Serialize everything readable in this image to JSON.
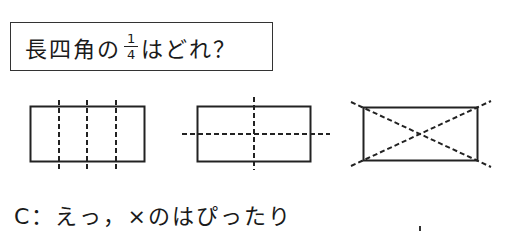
{
  "question": {
    "prefix": "長四角の",
    "fraction": {
      "numerator": "1",
      "denominator": "4"
    },
    "suffix": "はどれ？"
  },
  "figures": [
    {
      "id": "a",
      "description": "rectangle divided by three vertical dashed lines into four vertical strips"
    },
    {
      "id": "b",
      "description": "rectangle divided by one vertical and one horizontal dashed line into four quadrants"
    },
    {
      "id": "c",
      "description": "rectangle divided by two dashed diagonals into four triangles"
    }
  ],
  "dialogue": {
    "speaker": "C",
    "separator": "：",
    "text": "えっ，×のはぴったり"
  },
  "colors": {
    "ink": "#1a1a1a",
    "background": "#ffffff"
  }
}
